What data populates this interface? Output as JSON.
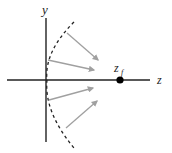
{
  "diagram": {
    "labels": {
      "y_axis": "y",
      "z_axis": "z",
      "focal_point": "z",
      "focal_point_subscript": "f"
    },
    "colors": {
      "axis": "#222222",
      "arc": "#222222",
      "arrow": "#a0a0a0",
      "focal_dot": "#000000",
      "background": "#ffffff"
    },
    "arrows": [
      {
        "from": [
          67,
          33
        ],
        "to": [
          98,
          60
        ]
      },
      {
        "from": [
          48,
          60
        ],
        "to": [
          94,
          70
        ]
      },
      {
        "from": [
          49,
          100
        ],
        "to": [
          93,
          88
        ]
      },
      {
        "from": [
          66,
          128
        ],
        "to": [
          97,
          101
        ]
      }
    ]
  }
}
